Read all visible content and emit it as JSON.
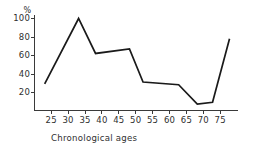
{
  "chart_data": {
    "type": "line",
    "title": "",
    "subtitle": "",
    "xlabel": "Chronological ages",
    "ylabel": "%",
    "y_unit_symbol": "%",
    "x": [
      23,
      33,
      38,
      48,
      52,
      62.5,
      68,
      72.5,
      77.5
    ],
    "values": [
      29,
      100,
      62,
      67,
      31,
      28,
      7,
      9,
      78
    ],
    "series": [
      {
        "name": "",
        "x": [
          23,
          33,
          38,
          48,
          52,
          62.5,
          68,
          72.5,
          77.5
        ],
        "values": [
          29,
          100,
          62,
          67,
          31,
          28,
          7,
          9,
          78
        ]
      }
    ],
    "xlim": [
      20,
      80
    ],
    "ylim": [
      0,
      100
    ],
    "xticks": [
      25,
      30,
      35,
      40,
      45,
      50,
      55,
      60,
      65,
      70,
      75
    ],
    "xtick_labels": [
      "25",
      "30",
      "35",
      "40",
      "45",
      "50",
      "55",
      "60",
      "65",
      "70",
      "75"
    ],
    "yticks": [
      20,
      40,
      60,
      80,
      100
    ],
    "ytick_labels": [
      "20",
      "40",
      "60",
      "80",
      "100"
    ],
    "grid": false,
    "legend": null,
    "legend_position": "none",
    "line_color": "#1a1a1a",
    "axis_color": "#3a3a3a",
    "background_color": "#ffffff",
    "annotations": []
  }
}
